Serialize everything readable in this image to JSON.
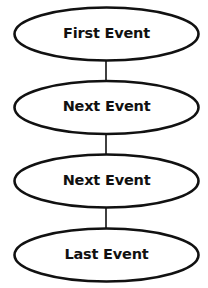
{
  "diagram": {
    "type": "vertical-flow",
    "nodes": [
      {
        "id": "n1",
        "label": "First Event"
      },
      {
        "id": "n2",
        "label": "Next Event"
      },
      {
        "id": "n3",
        "label": "Next Event"
      },
      {
        "id": "n4",
        "label": "Last Event"
      }
    ],
    "edges": [
      {
        "from": "n1",
        "to": "n2"
      },
      {
        "from": "n2",
        "to": "n3"
      },
      {
        "from": "n3",
        "to": "n4"
      }
    ],
    "colors": {
      "stroke": "#111111",
      "fill": "#ffffff",
      "text": "#111111"
    }
  }
}
